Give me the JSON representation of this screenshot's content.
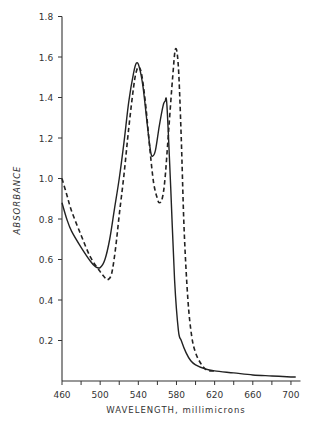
{
  "chart_data": {
    "type": "line",
    "title": "",
    "xlabel": "WAVELENGTH, millimicrons",
    "ylabel": "ABSORBANCE",
    "xlim": [
      460,
      710
    ],
    "ylim": [
      0,
      1.8
    ],
    "x_ticks": [
      460,
      480,
      500,
      520,
      540,
      560,
      580,
      600,
      620,
      640,
      660,
      680,
      700
    ],
    "x_tick_labels": [
      "460",
      "500",
      "540",
      "580",
      "620",
      "660",
      "700"
    ],
    "x_tick_label_values": [
      460,
      500,
      540,
      580,
      620,
      660,
      700
    ],
    "y_ticks": [
      0.2,
      0.4,
      0.6,
      0.8,
      1.0,
      1.2,
      1.4,
      1.6,
      1.8
    ],
    "y_tick_labels": [
      "0.2",
      "0.4",
      "0.6",
      "0.8",
      "1.0",
      "1.2",
      "1.4",
      "1.6",
      "1.8"
    ],
    "grid": false,
    "legend": null,
    "series": [
      {
        "name": "solid",
        "style": "solid",
        "x": [
          460,
          465,
          470,
          480,
          490,
          495,
          500,
          505,
          510,
          515,
          520,
          525,
          530,
          535,
          538,
          541,
          545,
          550,
          553,
          555,
          558,
          562,
          566,
          568,
          570,
          574,
          578,
          582,
          585,
          590,
          595,
          600,
          610,
          620,
          640,
          660,
          680,
          700,
          705
        ],
        "y": [
          0.88,
          0.8,
          0.74,
          0.66,
          0.59,
          0.565,
          0.56,
          0.6,
          0.7,
          0.85,
          1.0,
          1.18,
          1.38,
          1.52,
          1.57,
          1.55,
          1.45,
          1.24,
          1.13,
          1.11,
          1.14,
          1.26,
          1.36,
          1.38,
          1.36,
          0.95,
          0.5,
          0.25,
          0.2,
          0.14,
          0.1,
          0.08,
          0.06,
          0.05,
          0.04,
          0.03,
          0.025,
          0.02,
          0.02
        ]
      },
      {
        "name": "dashed",
        "style": "dashed",
        "x": [
          460,
          465,
          470,
          480,
          490,
          500,
          505,
          508,
          512,
          516,
          520,
          525,
          530,
          535,
          538,
          541,
          544,
          548,
          552,
          556,
          560,
          562,
          565,
          568,
          572,
          576,
          579,
          582,
          585,
          588,
          592,
          596,
          600,
          605,
          610,
          615,
          620
        ],
        "y": [
          1.0,
          0.92,
          0.84,
          0.72,
          0.61,
          0.54,
          0.51,
          0.5,
          0.53,
          0.65,
          0.82,
          1.02,
          1.25,
          1.45,
          1.53,
          1.55,
          1.5,
          1.35,
          1.15,
          0.98,
          0.9,
          0.88,
          0.9,
          1.0,
          1.25,
          1.5,
          1.64,
          1.55,
          1.2,
          0.75,
          0.4,
          0.22,
          0.14,
          0.09,
          0.06,
          0.05,
          0.05
        ]
      }
    ]
  },
  "axes": {
    "x_title": "WAVELENGTH, millimicrons",
    "y_title": "ABSORBANCE"
  }
}
